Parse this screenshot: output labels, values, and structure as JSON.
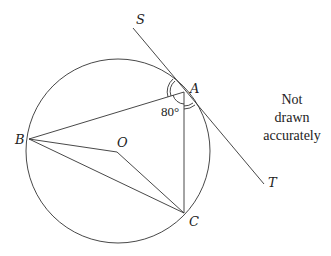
{
  "diagram": {
    "points": {
      "A": {
        "label": "A",
        "x": 184,
        "y": 92
      },
      "B": {
        "label": "B",
        "x": 29,
        "y": 139
      },
      "C": {
        "label": "C",
        "x": 184,
        "y": 213
      },
      "O": {
        "label": "O",
        "x": 117,
        "y": 152
      },
      "S": {
        "label": "S"
      },
      "T": {
        "label": "T"
      }
    },
    "circle": {
      "cx": 118,
      "cy": 151,
      "r": 92
    },
    "angle_label": "80°",
    "note": [
      "Not",
      "drawn",
      "accurately"
    ]
  }
}
